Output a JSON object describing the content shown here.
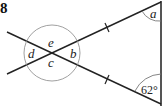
{
  "question_number": "8",
  "angles": {
    "a": "a",
    "b": "b",
    "c": "c",
    "d": "d",
    "e": "e",
    "given": "62°"
  },
  "colors": {
    "line": "#222222",
    "vertical_line": "#555555",
    "arc": "#777777"
  }
}
